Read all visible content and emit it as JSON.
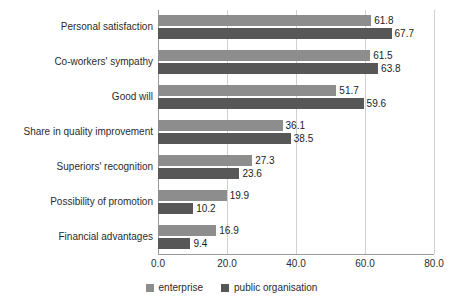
{
  "chart_data": {
    "type": "bar",
    "orientation": "horizontal",
    "title": "",
    "xlabel": "",
    "ylabel": "",
    "xlim": [
      0.0,
      80.0
    ],
    "xticks": [
      "0.0",
      "20.0",
      "40.0",
      "60.0",
      "80.0"
    ],
    "xtick_values": [
      0.0,
      20.0,
      40.0,
      60.0,
      80.0
    ],
    "grid": true,
    "legend_position": "bottom-center",
    "categories": [
      "Personal satisfaction",
      "Co-workers' sympathy",
      "Good will",
      "Share in quality improvement",
      "Superiors' recognition",
      "Possibility of promotion",
      "Financial advantages"
    ],
    "series": [
      {
        "name": "enterprise",
        "color": "#8d8d8d",
        "values": [
          61.8,
          61.5,
          51.7,
          36.1,
          27.3,
          19.9,
          16.9
        ],
        "labels": [
          "61.8",
          "61.5",
          "51.7",
          "36.1",
          "27.3",
          "19.9",
          "16.9"
        ]
      },
      {
        "name": "public organisation",
        "color": "#575757",
        "values": [
          67.7,
          63.8,
          59.6,
          38.5,
          23.6,
          10.2,
          9.4
        ],
        "labels": [
          "67.7",
          "63.8",
          "59.6",
          "38.5",
          "23.6",
          "10.2",
          "9.4"
        ]
      }
    ]
  },
  "legend": {
    "items": [
      {
        "label": "enterprise",
        "color": "#8d8d8d"
      },
      {
        "label": "public organisation",
        "color": "#575757"
      }
    ]
  }
}
